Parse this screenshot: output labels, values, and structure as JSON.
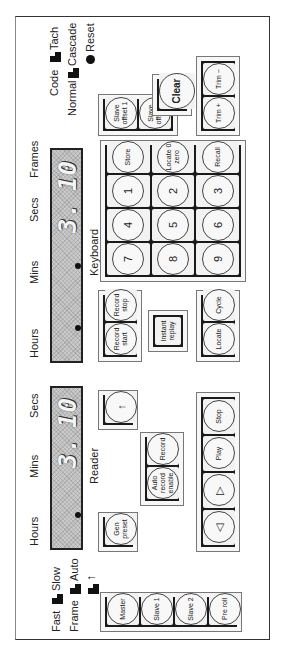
{
  "panel": {
    "orientation": "rotated 90° counter-clockwise",
    "reader": {
      "label": "Reader",
      "field_labels": [
        "Hours",
        "Mins",
        "Secs"
      ],
      "display_mins": "3.",
      "display_secs": "10"
    },
    "keyboard": {
      "label": "Keyboard",
      "field_labels": [
        "Hours",
        "Mins",
        "Secs",
        "Frames"
      ],
      "display_secs": "3.",
      "display_frames": "10"
    },
    "switches_left": [
      {
        "left": "Fast",
        "right": "Slow"
      },
      {
        "left": "Frame",
        "right": "Auto"
      },
      {
        "left": "",
        "right": "↑"
      }
    ],
    "switches_right": [
      {
        "left": "Code",
        "right": "Tach"
      },
      {
        "left": "Normal",
        "right": "Cascade"
      }
    ],
    "reset_label": "Reset",
    "buttons": {
      "master_group": [
        "Master",
        "Slave 1",
        "Slave 2",
        "Pre roll"
      ],
      "gen_preset": "Gen preset",
      "arrow_up": "↑",
      "record_group": [
        "Auto record enable",
        "Record"
      ],
      "transport_group": [
        "◁",
        "▷",
        "Play",
        "Stop"
      ],
      "record_start_stop": [
        "Record start",
        "Record stop"
      ],
      "instant_replay": "Instant replay",
      "locate_group": [
        "Locate",
        "Cycle"
      ],
      "keypad": [
        [
          "7",
          "8",
          "9"
        ],
        [
          "4",
          "5",
          "6"
        ],
        [
          "1",
          "2",
          "3"
        ],
        [
          "Store",
          "Locate 0 zero",
          "Recall"
        ]
      ],
      "slave_offset": [
        "Slave offset 1",
        "Slave offset 2"
      ],
      "clear": "Clear",
      "trim": [
        "Trim +",
        "Trim −"
      ]
    }
  }
}
